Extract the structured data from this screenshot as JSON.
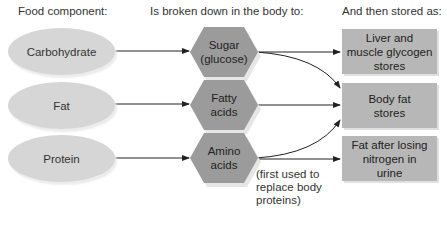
{
  "headers": {
    "column1": "Food component:",
    "column2": "Is broken down in the body to:",
    "column3": "And then stored as:"
  },
  "food_components": [
    {
      "label": "Carbohydrate"
    },
    {
      "label": "Fat"
    },
    {
      "label": "Protein"
    }
  ],
  "breakdown_products": [
    {
      "line1": "Sugar",
      "line2": "(glucose)"
    },
    {
      "line1": "Fatty",
      "line2": "acids"
    },
    {
      "line1": "Amino",
      "line2": "acids"
    }
  ],
  "storage_forms": [
    {
      "line1": "Liver and",
      "line2": "muscle glycogen",
      "line3": "stores"
    },
    {
      "line1": "Body fat",
      "line2": "stores",
      "line3": ""
    },
    {
      "line1": "Fat after losing",
      "line2": "nitrogen in",
      "line3": "urine"
    }
  ],
  "note": {
    "line1": "(first used to",
    "line2": "replace body",
    "line3": "proteins)"
  },
  "colors": {
    "oval_fill": "#d6d6d6",
    "hexagon_fill": "#9b9b9b",
    "rectangle_fill": "#b7b7b7",
    "arrow": "#222222"
  }
}
